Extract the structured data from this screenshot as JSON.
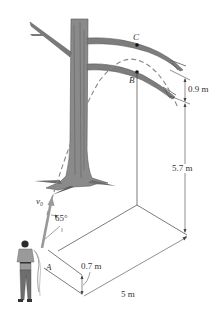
{
  "figure": {
    "points": {
      "A": "A",
      "B": "B",
      "C": "C"
    },
    "velocity_label": "v₀",
    "angle_label": "65°",
    "dimensions": {
      "branch_gap": "0.9 m",
      "height_to_B": "5.7 m",
      "launch_height": "0.7 m",
      "horizontal_distance": "5 m"
    },
    "colors": {
      "line": "#444444",
      "trajectory_dashed": "#888888",
      "tree_bark": "#7a7a7a",
      "velocity_arrow": "#999999"
    }
  }
}
